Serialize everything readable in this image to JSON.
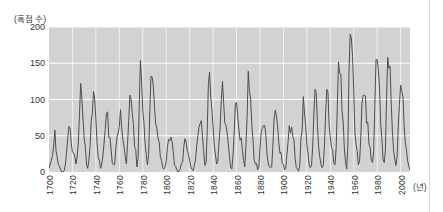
{
  "figure": {
    "y_axis_unit_label": "(흑점 수)",
    "x_axis_unit_label": "(년)",
    "panel_background": "#d2d2d2",
    "grid_color": "#ffffff",
    "line_color": "#4d4d4d"
  },
  "chart_data": {
    "type": "line",
    "title": "",
    "xlabel": "(년)",
    "ylabel": "(흑점 수)",
    "xlim": [
      1700,
      2008
    ],
    "ylim": [
      0,
      200
    ],
    "grid": true,
    "legend": "none",
    "yticks": [
      0,
      50,
      100,
      150,
      200
    ],
    "xticks": [
      1700,
      1720,
      1740,
      1760,
      1780,
      1800,
      1820,
      1840,
      1860,
      1880,
      1900,
      1920,
      1940,
      1960,
      1980,
      2000
    ],
    "series": [
      {
        "name": "연평균 흑점 수",
        "x": [
          1700,
          1701,
          1702,
          1703,
          1704,
          1705,
          1706,
          1707,
          1708,
          1709,
          1710,
          1711,
          1712,
          1713,
          1714,
          1715,
          1716,
          1717,
          1718,
          1719,
          1720,
          1721,
          1722,
          1723,
          1724,
          1725,
          1726,
          1727,
          1728,
          1729,
          1730,
          1731,
          1732,
          1733,
          1734,
          1735,
          1736,
          1737,
          1738,
          1739,
          1740,
          1741,
          1742,
          1743,
          1744,
          1745,
          1746,
          1747,
          1748,
          1749,
          1750,
          1751,
          1752,
          1753,
          1754,
          1755,
          1756,
          1757,
          1758,
          1759,
          1760,
          1761,
          1762,
          1763,
          1764,
          1765,
          1766,
          1767,
          1768,
          1769,
          1770,
          1771,
          1772,
          1773,
          1774,
          1775,
          1776,
          1777,
          1778,
          1779,
          1780,
          1781,
          1782,
          1783,
          1784,
          1785,
          1786,
          1787,
          1788,
          1789,
          1790,
          1791,
          1792,
          1793,
          1794,
          1795,
          1796,
          1797,
          1798,
          1799,
          1800,
          1801,
          1802,
          1803,
          1804,
          1805,
          1806,
          1807,
          1808,
          1809,
          1810,
          1811,
          1812,
          1813,
          1814,
          1815,
          1816,
          1817,
          1818,
          1819,
          1820,
          1821,
          1822,
          1823,
          1824,
          1825,
          1826,
          1827,
          1828,
          1829,
          1830,
          1831,
          1832,
          1833,
          1834,
          1835,
          1836,
          1837,
          1838,
          1839,
          1840,
          1841,
          1842,
          1843,
          1844,
          1845,
          1846,
          1847,
          1848,
          1849,
          1850,
          1851,
          1852,
          1853,
          1854,
          1855,
          1856,
          1857,
          1858,
          1859,
          1860,
          1861,
          1862,
          1863,
          1864,
          1865,
          1866,
          1867,
          1868,
          1869,
          1870,
          1871,
          1872,
          1873,
          1874,
          1875,
          1876,
          1877,
          1878,
          1879,
          1880,
          1881,
          1882,
          1883,
          1884,
          1885,
          1886,
          1887,
          1888,
          1889,
          1890,
          1891,
          1892,
          1893,
          1894,
          1895,
          1896,
          1897,
          1898,
          1899,
          1900,
          1901,
          1902,
          1903,
          1904,
          1905,
          1906,
          1907,
          1908,
          1909,
          1910,
          1911,
          1912,
          1913,
          1914,
          1915,
          1916,
          1917,
          1918,
          1919,
          1920,
          1921,
          1922,
          1923,
          1924,
          1925,
          1926,
          1927,
          1928,
          1929,
          1930,
          1931,
          1932,
          1933,
          1934,
          1935,
          1936,
          1937,
          1938,
          1939,
          1940,
          1941,
          1942,
          1943,
          1944,
          1945,
          1946,
          1947,
          1948,
          1949,
          1950,
          1951,
          1952,
          1953,
          1954,
          1955,
          1956,
          1957,
          1958,
          1959,
          1960,
          1961,
          1962,
          1963,
          1964,
          1965,
          1966,
          1967,
          1968,
          1969,
          1970,
          1971,
          1972,
          1973,
          1974,
          1975,
          1976,
          1977,
          1978,
          1979,
          1980,
          1981,
          1982,
          1983,
          1984,
          1985,
          1986,
          1987,
          1988,
          1989,
          1990,
          1991,
          1992,
          1993,
          1994,
          1995,
          1996,
          1997,
          1998,
          1999,
          2000,
          2001,
          2002,
          2003,
          2004,
          2005,
          2006,
          2007,
          2008
        ],
        "values": [
          5,
          11,
          16,
          23,
          36,
          58,
          29,
          20,
          10,
          8,
          3,
          0,
          0,
          2,
          11,
          27,
          47,
          63,
          60,
          39,
          28,
          26,
          22,
          11,
          21,
          40,
          78,
          122,
          103,
          73,
          47,
          35,
          11,
          5,
          16,
          34,
          70,
          81,
          111,
          101,
          73,
          40,
          20,
          16,
          5,
          11,
          22,
          40,
          60,
          81,
          83,
          48,
          48,
          31,
          12,
          10,
          10,
          32,
          48,
          54,
          63,
          86,
          61,
          45,
          36,
          21,
          11,
          38,
          70,
          106,
          101,
          82,
          67,
          35,
          31,
          7,
          20,
          93,
          154,
          126,
          85,
          68,
          39,
          23,
          10,
          24,
          83,
          132,
          131,
          118,
          90,
          67,
          60,
          47,
          41,
          21,
          16,
          6,
          4,
          7,
          14,
          34,
          45,
          43,
          48,
          42,
          28,
          10,
          8,
          3,
          0,
          1,
          5,
          12,
          14,
          35,
          46,
          41,
          30,
          24,
          16,
          7,
          4,
          2,
          9,
          17,
          36,
          50,
          62,
          67,
          71,
          48,
          28,
          9,
          13,
          57,
          122,
          138,
          103,
          86,
          63,
          37,
          24,
          11,
          15,
          40,
          62,
          99,
          125,
          96,
          67,
          65,
          54,
          39,
          21,
          7,
          4,
          23,
          55,
          94,
          96,
          77,
          59,
          44,
          47,
          30,
          16,
          7,
          37,
          74,
          139,
          111,
          102,
          66,
          45,
          17,
          11,
          12,
          3,
          6,
          32,
          54,
          60,
          64,
          64,
          52,
          25,
          13,
          7,
          6,
          7,
          36,
          73,
          85,
          78,
          64,
          42,
          26,
          27,
          12,
          10,
          3,
          5,
          24,
          42,
          64,
          54,
          62,
          49,
          44,
          19,
          6,
          4,
          1,
          10,
          47,
          57,
          104,
          81,
          64,
          38,
          25,
          10,
          6,
          9,
          36,
          80,
          114,
          110,
          65,
          36,
          21,
          11,
          6,
          9,
          36,
          80,
          114,
          110,
          65,
          48,
          34,
          30,
          12,
          10,
          33,
          93,
          152,
          136,
          135,
          84,
          69,
          32,
          14,
          4,
          38,
          142,
          190,
          185,
          159,
          112,
          54,
          38,
          28,
          10,
          15,
          47,
          94,
          106,
          106,
          105,
          67,
          69,
          38,
          34,
          16,
          13,
          28,
          93,
          155,
          155,
          140,
          116,
          67,
          46,
          18,
          13,
          29,
          100,
          158,
          143,
          146,
          94,
          55,
          30,
          18,
          9,
          21,
          64,
          93,
          120,
          111,
          104,
          64,
          40,
          30,
          15,
          8,
          3
        ]
      }
    ],
    "annotations": [
      {
        "text": "Dalton minimum (low cycles)",
        "x_range": [
          1800,
          1830
        ]
      },
      {
        "text": "Modern maximum (highest peak ~190)",
        "x": 1957
      }
    ]
  },
  "y_ticks": [
    {
      "label": "200",
      "value": 200
    },
    {
      "label": "150",
      "value": 150
    },
    {
      "label": "100",
      "value": 100
    },
    {
      "label": "50",
      "value": 50
    },
    {
      "label": "0",
      "value": 0
    }
  ],
  "x_ticks": [
    {
      "label": "1700"
    },
    {
      "label": "1720"
    },
    {
      "label": "1740"
    },
    {
      "label": "1760"
    },
    {
      "label": "1780"
    },
    {
      "label": "1800"
    },
    {
      "label": "1820"
    },
    {
      "label": "1840"
    },
    {
      "label": "1860"
    },
    {
      "label": "1880"
    },
    {
      "label": "1900"
    },
    {
      "label": "1920"
    },
    {
      "label": "1940"
    },
    {
      "label": "1960"
    },
    {
      "label": "1980"
    },
    {
      "label": "2000"
    }
  ]
}
